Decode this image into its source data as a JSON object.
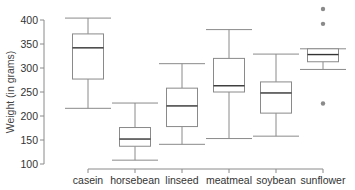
{
  "chart_data": {
    "type": "box",
    "title": "",
    "xlabel": "",
    "ylabel": "Weight (in grams)",
    "ylim": [
      100,
      430
    ],
    "yticks": [
      100,
      150,
      200,
      250,
      300,
      350,
      400
    ],
    "grid": false,
    "categories": [
      "casein",
      "horsebean",
      "linseed",
      "meatmeal",
      "soybean",
      "sunflower"
    ],
    "series": [
      {
        "name": "casein",
        "whisker_low": 216,
        "q1": 277,
        "median": 342,
        "q3": 371,
        "whisker_high": 404,
        "outliers": []
      },
      {
        "name": "horsebean",
        "whisker_low": 108,
        "q1": 137,
        "median": 152,
        "q3": 176,
        "whisker_high": 227,
        "outliers": []
      },
      {
        "name": "linseed",
        "whisker_low": 141,
        "q1": 178,
        "median": 221,
        "q3": 258,
        "whisker_high": 309,
        "outliers": []
      },
      {
        "name": "meatmeal",
        "whisker_low": 153,
        "q1": 250,
        "median": 263,
        "q3": 320,
        "whisker_high": 380,
        "outliers": []
      },
      {
        "name": "soybean",
        "whisker_low": 158,
        "q1": 206,
        "median": 248,
        "q3": 271,
        "whisker_high": 329,
        "outliers": []
      },
      {
        "name": "sunflower",
        "whisker_low": 297,
        "q1": 313,
        "median": 328,
        "q3": 340,
        "whisker_high": 340,
        "outliers": [
          226,
          392,
          423
        ]
      }
    ]
  }
}
